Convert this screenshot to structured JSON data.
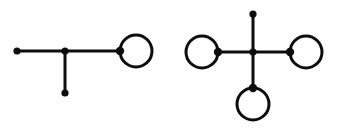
{
  "figure": {
    "name": "graph-pair-figure",
    "background_color": "#fefefe",
    "ink_color": "#0d0d0d",
    "width": 341,
    "height": 129,
    "stroke_width": 3,
    "vertex_radius": 3.6,
    "loop_radius": 16,
    "caption": "",
    "diagrams": [
      {
        "id": "left-graph",
        "label": "",
        "description": "Tree with three straight edges meeting at a central vertex, plus one self-loop at the right vertex",
        "vertices": [
          {
            "id": "L1",
            "name": "left-endpoint-vertex",
            "cx": 17,
            "cy": 51,
            "loop": false
          },
          {
            "id": "L2",
            "name": "center-junction-vertex",
            "cx": 65,
            "cy": 51,
            "loop": false
          },
          {
            "id": "L3",
            "name": "bottom-pendant-vertex",
            "cx": 65,
            "cy": 93,
            "loop": false
          },
          {
            "id": "L4",
            "name": "right-loop-vertex",
            "cx": 120,
            "cy": 51,
            "loop": true,
            "loop_direction": "right"
          }
        ],
        "edges": [
          {
            "id": "LE1",
            "name": "edge-left-to-center",
            "x1": 17,
            "y1": 51,
            "x2": 65,
            "y2": 51
          },
          {
            "id": "LE2",
            "name": "edge-center-to-right",
            "x1": 65,
            "y1": 51,
            "x2": 120,
            "y2": 51
          },
          {
            "id": "LE3",
            "name": "edge-center-to-bottom",
            "x1": 65,
            "y1": 51,
            "x2": 65,
            "y2": 93
          }
        ],
        "loops": [
          {
            "id": "LL1",
            "name": "self-loop-right",
            "cx": 136,
            "cy": 51,
            "r": 16,
            "attached_vertex": "L4"
          }
        ]
      },
      {
        "id": "right-graph",
        "label": "",
        "description": "Star with four edges from a central vertex; three outer vertices carry self-loops and one is a plain pendant",
        "vertices": [
          {
            "id": "R1",
            "name": "top-pendant-vertex",
            "cx": 253,
            "cy": 14,
            "loop": false
          },
          {
            "id": "R2",
            "name": "center-junction-vertex",
            "cx": 253,
            "cy": 52,
            "loop": false
          },
          {
            "id": "R3",
            "name": "left-loop-vertex",
            "cx": 218,
            "cy": 52,
            "loop": true,
            "loop_direction": "left"
          },
          {
            "id": "R4",
            "name": "right-loop-vertex",
            "cx": 290,
            "cy": 52,
            "loop": true,
            "loop_direction": "right"
          },
          {
            "id": "R5",
            "name": "bottom-loop-vertex",
            "cx": 253,
            "cy": 88,
            "loop": true,
            "loop_direction": "down"
          }
        ],
        "edges": [
          {
            "id": "RE1",
            "name": "edge-center-to-top",
            "x1": 253,
            "y1": 14,
            "x2": 253,
            "y2": 52
          },
          {
            "id": "RE2",
            "name": "edge-center-to-left",
            "x1": 218,
            "y1": 52,
            "x2": 253,
            "y2": 52
          },
          {
            "id": "RE3",
            "name": "edge-center-to-right",
            "x1": 253,
            "y1": 52,
            "x2": 290,
            "y2": 52
          },
          {
            "id": "RE4",
            "name": "edge-center-to-bottom",
            "x1": 253,
            "y1": 52,
            "x2": 253,
            "y2": 88
          }
        ],
        "loops": [
          {
            "id": "RL1",
            "name": "self-loop-left",
            "cx": 202,
            "cy": 52,
            "r": 16,
            "attached_vertex": "R3"
          },
          {
            "id": "RL2",
            "name": "self-loop-right",
            "cx": 306,
            "cy": 52,
            "r": 16,
            "attached_vertex": "R4"
          },
          {
            "id": "RL3",
            "name": "self-loop-bottom",
            "cx": 253,
            "cy": 104,
            "r": 16,
            "attached_vertex": "R5"
          }
        ]
      }
    ]
  }
}
